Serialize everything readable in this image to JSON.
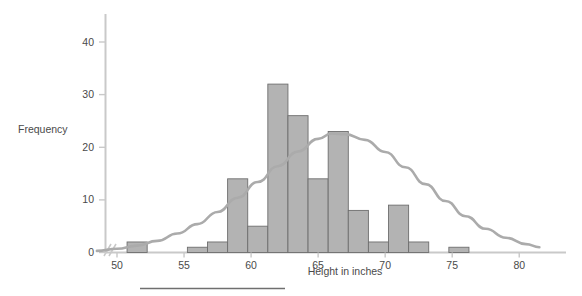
{
  "chart_data": {
    "type": "bar",
    "title": "",
    "subtitle": "",
    "xlabel": "Height in inches",
    "ylabel": "Frequency",
    "xlim": [
      48.5,
      81.5
    ],
    "ylim": [
      0,
      44
    ],
    "grid": false,
    "legend": null,
    "axis_break_x": true,
    "bin_width": 1.5,
    "bar_color": "#b3b3b3",
    "bar_edge_color": "#6e6e6e",
    "curve_color": "#a8a8a8",
    "axis_color": "#c8c8c8",
    "categories": [
      51.5,
      53.0,
      54.5,
      56.0,
      57.5,
      59.0,
      60.5,
      62.0,
      63.5,
      65.0,
      66.5,
      68.0,
      69.5,
      71.0,
      72.5,
      74.0,
      75.5,
      77.0,
      78.5
    ],
    "bin_edges": [
      50.75,
      52.25,
      53.75,
      55.25,
      56.75,
      58.25,
      59.75,
      61.25,
      62.75,
      64.25,
      65.75,
      67.25,
      68.75,
      70.25,
      71.75,
      73.25,
      74.75,
      76.25,
      77.75,
      79.25
    ],
    "values": [
      2,
      0,
      0,
      1,
      2,
      14,
      5,
      32,
      26,
      14,
      23,
      8,
      2,
      9,
      2,
      0,
      1,
      0,
      0
    ],
    "xticks": [
      50,
      55,
      60,
      65,
      70,
      75,
      80
    ],
    "xtick_labels": [
      "50",
      "55",
      "60",
      "65",
      "70",
      "75",
      "80"
    ],
    "yticks": [
      0,
      10,
      20,
      30,
      40
    ],
    "ytick_labels": [
      "0",
      "10",
      "20",
      "30",
      "40"
    ],
    "overlay_curve": {
      "name": "normal-density-overlay",
      "type": "line",
      "mean": 66.0,
      "peak_value": 22.8,
      "std_dev": 5.2,
      "x": [
        48.5,
        50,
        51.5,
        53,
        54.5,
        56,
        57.5,
        59,
        60.5,
        62,
        63.5,
        65,
        66,
        67,
        68.5,
        70,
        71.5,
        73,
        74.5,
        76,
        77.5,
        79,
        80.5,
        81.5
      ],
      "y": [
        0.3,
        0.7,
        1.3,
        2.2,
        3.6,
        5.4,
        7.7,
        10.4,
        13.4,
        16.4,
        19.2,
        21.6,
        22.6,
        22.5,
        21.4,
        19.1,
        16.2,
        13.0,
        9.8,
        6.9,
        4.5,
        2.8,
        1.6,
        1.0
      ]
    }
  },
  "axes": {
    "y_title": "Frequency",
    "x_title": "Height in inches"
  },
  "footer": {
    "rule": ""
  }
}
